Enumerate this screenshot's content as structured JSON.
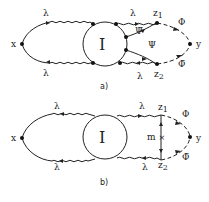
{
  "diagram_a": {
    "caption": "a)",
    "vertex_left": "x",
    "vertex_right": "y",
    "blob": "I",
    "z_top": "z",
    "z_top_sub": "1",
    "z_bottom": "z",
    "z_bottom_sub": "2",
    "lambda_top_left": "λ",
    "lambda_bottom_left": "λ",
    "lambda_top_right": "λ",
    "lambda_bottom_right": "λ",
    "psi_bar": "Ψ̄",
    "psi": "Ψ",
    "phi": "Φ",
    "phi_bar": "Φ̄"
  },
  "diagram_b": {
    "caption": "b)",
    "vertex_left": "x",
    "vertex_right": "y",
    "blob": "I",
    "z_top": "z",
    "z_top_sub": "1",
    "z_bottom": "z",
    "z_bottom_sub": "2",
    "lambda_top_left": "λ",
    "lambda_bottom_left": "λ",
    "lambda_top_right": "λ",
    "lambda_bottom_right": "λ",
    "m_label": "m",
    "phi": "Φ",
    "phi_bar": "Φ̄"
  }
}
